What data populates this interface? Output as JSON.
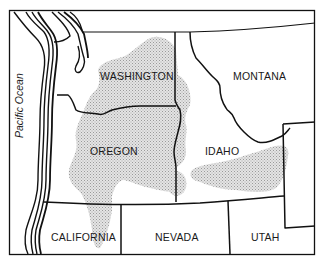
{
  "map": {
    "ocean_label": "Pacific Ocean",
    "states": [
      {
        "name": "WASHINGTON",
        "x": 140,
        "y": 80
      },
      {
        "name": "MONTANA",
        "x": 238,
        "y": 80
      },
      {
        "name": "OREGON",
        "x": 132,
        "y": 155
      },
      {
        "name": "IDAHO",
        "x": 220,
        "y": 155
      },
      {
        "name": "CALIFORNIA",
        "x": 84,
        "y": 240
      },
      {
        "name": "NEVADA",
        "x": 178,
        "y": 240
      },
      {
        "name": "UTAH",
        "x": 270,
        "y": 240
      }
    ],
    "shaded_region": "stippled gray area (Columbia Plateau / Snake River Plain)",
    "colors": {
      "line": "#111111",
      "shade": "#c8c8c8",
      "background": "#ffffff"
    }
  }
}
